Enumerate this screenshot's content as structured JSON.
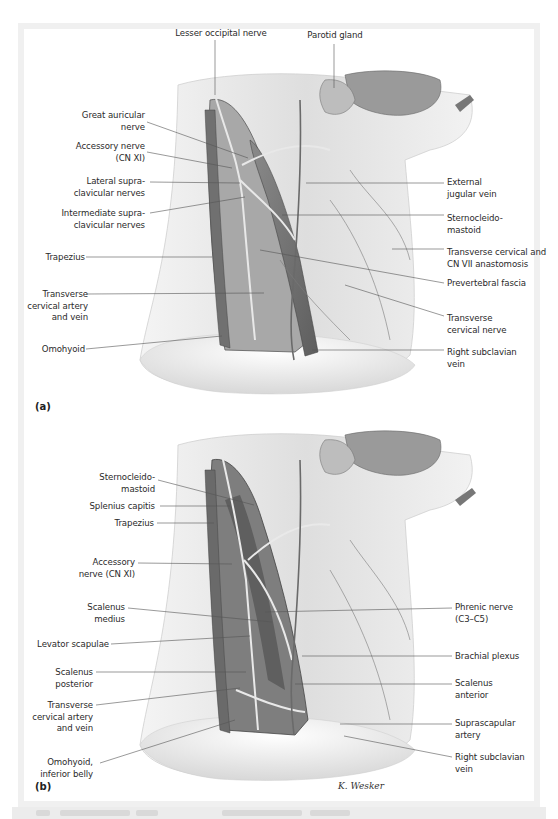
{
  "figure": {
    "panels": [
      {
        "id": "(a)",
        "labels_left": [
          {
            "text": "Great auricular\nnerve"
          },
          {
            "text": "Accessory nerve\n(CN XI)"
          },
          {
            "text": "Lateral supra-\nclavicular nerves"
          },
          {
            "text": "Intermediate supra-\nclavicular nerves"
          },
          {
            "text": "Trapezius"
          },
          {
            "text": "Transverse\ncervical artery\nand vein"
          },
          {
            "text": "Omohyoid"
          }
        ],
        "labels_top": [
          {
            "text": "Lesser occipital nerve"
          },
          {
            "text": "Parotid gland"
          }
        ],
        "labels_right": [
          {
            "text": "External\njugular vein"
          },
          {
            "text": "Sternocleido-\nmastoid"
          },
          {
            "text": "Transverse cervical and\nCN VII anastomosis"
          },
          {
            "text": "Prevertebral fascia"
          },
          {
            "text": "Transverse\ncervical nerve"
          },
          {
            "text": "Right subclavian\nvein"
          }
        ]
      },
      {
        "id": "(b)",
        "labels_left": [
          {
            "text": "Sternocleido-\nmastoid"
          },
          {
            "text": "Splenius capitis"
          },
          {
            "text": "Trapezius"
          },
          {
            "text": "Accessory\nnerve (CN XI)"
          },
          {
            "text": "Scalenus\nmedius"
          },
          {
            "text": "Levator scapulae"
          },
          {
            "text": "Scalenus\nposterior"
          },
          {
            "text": "Transverse\ncervical artery\nand vein"
          },
          {
            "text": "Omohyoid,\ninferior belly"
          }
        ],
        "labels_right": [
          {
            "text": "Phrenic nerve\n(C3–C5)"
          },
          {
            "text": "Brachial plexus"
          },
          {
            "text": "Scalenus\nanterior"
          },
          {
            "text": "Suprascapular\nartery"
          },
          {
            "text": "Right subclavian\nvein"
          }
        ],
        "signature": "K. Wesker"
      }
    ],
    "colors": {
      "frame": "#f0f0f0",
      "panel": "#ffffff",
      "label_text": "#2a2a2a",
      "leader_line": "#555555",
      "muscle_dark": "#6e6e6e",
      "skin_light": "#e6e6e6"
    }
  }
}
